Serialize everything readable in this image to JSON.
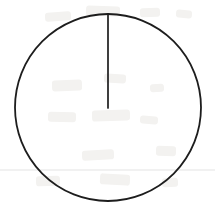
{
  "page": {
    "title": "Circle with radius segment",
    "background_color": "#ffffff",
    "width": 215,
    "height": 217,
    "media": "ruled-paper-scan"
  },
  "paper": {
    "ruled_line": {
      "label": "faint horizontal ruled line",
      "color": "#ededed",
      "y": 170,
      "x_start": 0,
      "x_end": 215,
      "thickness": 1.4
    },
    "show_through_marks": {
      "label": "faint bleed-through marks from reverse side",
      "color": "#f3f2f0",
      "marks": [
        {
          "x": 45,
          "y": 12,
          "w": 26,
          "h": 9,
          "rot": -4
        },
        {
          "x": 86,
          "y": 6,
          "w": 34,
          "h": 10,
          "rot": 2
        },
        {
          "x": 140,
          "y": 8,
          "w": 20,
          "h": 9,
          "rot": -3
        },
        {
          "x": 176,
          "y": 10,
          "w": 16,
          "h": 8,
          "rot": 5
        },
        {
          "x": 52,
          "y": 80,
          "w": 30,
          "h": 11,
          "rot": -2
        },
        {
          "x": 104,
          "y": 74,
          "w": 22,
          "h": 9,
          "rot": 3
        },
        {
          "x": 150,
          "y": 84,
          "w": 14,
          "h": 8,
          "rot": -5
        },
        {
          "x": 48,
          "y": 112,
          "w": 28,
          "h": 10,
          "rot": 1
        },
        {
          "x": 92,
          "y": 110,
          "w": 38,
          "h": 11,
          "rot": -2
        },
        {
          "x": 140,
          "y": 116,
          "w": 18,
          "h": 8,
          "rot": 4
        },
        {
          "x": 82,
          "y": 150,
          "w": 32,
          "h": 10,
          "rot": -3
        },
        {
          "x": 156,
          "y": 146,
          "w": 20,
          "h": 10,
          "rot": 2
        },
        {
          "x": 36,
          "y": 176,
          "w": 24,
          "h": 10,
          "rot": -2
        },
        {
          "x": 100,
          "y": 174,
          "w": 30,
          "h": 11,
          "rot": 3
        },
        {
          "x": 162,
          "y": 178,
          "w": 16,
          "h": 9,
          "rot": -4
        }
      ]
    }
  },
  "figure": {
    "name": "circle-with-radius",
    "stroke_color": "#1d1d1d",
    "circle": {
      "label": "circle outline",
      "center_x": 108,
      "center_y": 107.5,
      "radius_x": 93,
      "radius_y": 93.5,
      "stroke_width": 1.8,
      "fill": "none"
    },
    "radius_segment": {
      "label": "radius drawn from top of circle to center",
      "x1": 108,
      "y1": 15,
      "x2": 108,
      "y2": 108,
      "stroke_width": 1.7,
      "length_px": 93,
      "orientation": "vertical",
      "angle_degrees": 90
    }
  },
  "annotations": {
    "labels": []
  }
}
